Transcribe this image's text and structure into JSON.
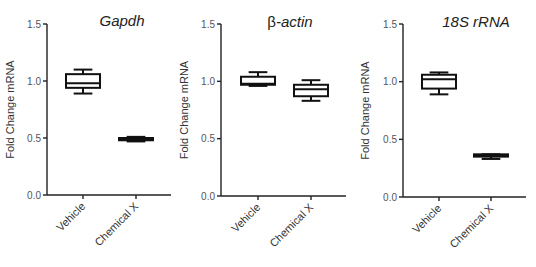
{
  "chart_data": [
    {
      "type": "box",
      "title": "Gapdh",
      "title_prefix": "",
      "xlabel": "",
      "ylabel": "Fold Change mRNA",
      "ylim": [
        0.0,
        1.5
      ],
      "yticks": [
        "0.0",
        "0.5",
        "1.0",
        "1.5"
      ],
      "categories": [
        "Vehicle",
        "Chemical X"
      ],
      "series": [
        {
          "name": "Vehicle",
          "min": 0.89,
          "q1": 0.94,
          "median": 0.98,
          "q3": 1.06,
          "max": 1.1
        },
        {
          "name": "Chemical X",
          "min": 0.47,
          "q1": 0.48,
          "median": 0.49,
          "q3": 0.5,
          "max": 0.51
        }
      ],
      "grid": false,
      "legend": "none"
    },
    {
      "type": "box",
      "title": "-actin",
      "title_prefix": "β",
      "xlabel": "",
      "ylabel": "Fold Change mRNA",
      "ylim": [
        0.0,
        1.5
      ],
      "yticks": [
        "0.0",
        "0.5",
        "1.0",
        "1.5"
      ],
      "categories": [
        "Vehicle",
        "Chemical X"
      ],
      "series": [
        {
          "name": "Vehicle",
          "min": 0.96,
          "q1": 0.97,
          "median": 0.98,
          "q3": 1.04,
          "max": 1.08
        },
        {
          "name": "Chemical X",
          "min": 0.83,
          "q1": 0.87,
          "median": 0.93,
          "q3": 0.97,
          "max": 1.01
        }
      ],
      "grid": false,
      "legend": "none"
    },
    {
      "type": "box",
      "title": "18S rRNA",
      "title_prefix": "",
      "xlabel": "",
      "ylabel": "Fold Change mRNA",
      "ylim": [
        0.0,
        1.5
      ],
      "yticks": [
        "0.0",
        "0.5",
        "1.0",
        "1.5"
      ],
      "categories": [
        "Vehicle",
        "Chemical X"
      ],
      "series": [
        {
          "name": "Vehicle",
          "min": 0.89,
          "q1": 0.94,
          "median": 1.02,
          "q3": 1.06,
          "max": 1.08
        },
        {
          "name": "Chemical X",
          "min": 0.33,
          "q1": 0.35,
          "median": 0.36,
          "q3": 0.37,
          "max": 0.37
        }
      ],
      "grid": false,
      "legend": "none"
    }
  ],
  "layout": {
    "panels": [
      {
        "axis_x": 47,
        "x_end": 171,
        "y0": 195,
        "y15": 24,
        "cat_x": [
          83,
          136
        ],
        "box_half": 17,
        "title_x": 122,
        "title_y": 26,
        "ylabel_x": 14
      },
      {
        "axis_x": 221,
        "x_end": 346,
        "y0": 196,
        "y15": 24,
        "cat_x": [
          258,
          311
        ],
        "box_half": 17,
        "title_x": 290,
        "title_y": 27,
        "ylabel_x": 188
      },
      {
        "axis_x": 403,
        "x_end": 526,
        "y0": 197,
        "y15": 24,
        "cat_x": [
          439,
          491
        ],
        "box_half": 17,
        "title_x": 476,
        "title_y": 27,
        "ylabel_x": 369
      }
    ]
  }
}
